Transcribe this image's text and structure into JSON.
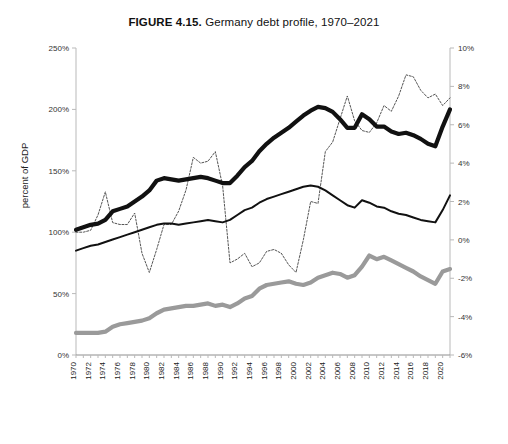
{
  "figure": {
    "label": "FIGURE 4.15.",
    "title_rest": " Germany debt profile, 1970–2021",
    "full_title": "FIGURE 4.15. Germany debt profile, 1970–2021"
  },
  "annotation": {
    "line1": "Global Financial",
    "line2": "Crisis of 2008",
    "year": 2008
  },
  "legend": {
    "position": "bottom",
    "items": [
      {
        "label": "Total debt to GDP",
        "style": "thick-solid",
        "color": "#111111"
      },
      {
        "label": "Private debt to GDP",
        "style": "thin-solid",
        "color": "#111111"
      },
      {
        "label": "Public debt to GDP",
        "style": "thick-solid",
        "color": "#9a9a9a"
      },
      {
        "label": "Current account balance to GDP (right axis scale)",
        "style": "dotted",
        "color": "#555555"
      }
    ]
  },
  "chart_data": {
    "type": "line",
    "title": "FIGURE 4.15. Germany debt profile, 1970–2021",
    "xlabel": "",
    "ylabel": "percent of GDP",
    "ylabel_right": "",
    "grid": false,
    "xlim": [
      1970,
      2021
    ],
    "ylim": [
      0,
      250
    ],
    "ylim_right": [
      -6,
      10
    ],
    "yticks": [
      "0%",
      "50%",
      "100%",
      "150%",
      "200%",
      "250%"
    ],
    "ytick_values": [
      0,
      50,
      100,
      150,
      200,
      250
    ],
    "yticks_right": [
      "-6%",
      "-4%",
      "-2%",
      "0%",
      "2%",
      "4%",
      "6%",
      "8%",
      "10%"
    ],
    "ytick_values_right": [
      -6,
      -4,
      -2,
      0,
      2,
      4,
      6,
      8,
      10
    ],
    "xtick_labels": [
      "1970",
      "1972",
      "1974",
      "1976",
      "1978",
      "1980",
      "1982",
      "1984",
      "1986",
      "1988",
      "1990",
      "1992",
      "1994",
      "1996",
      "1998",
      "2000",
      "2002",
      "2004",
      "2006",
      "2008",
      "2010",
      "2012",
      "2014",
      "2016",
      "2018",
      "2020"
    ],
    "x": [
      1970,
      1971,
      1972,
      1973,
      1974,
      1975,
      1976,
      1977,
      1978,
      1979,
      1980,
      1981,
      1982,
      1983,
      1984,
      1985,
      1986,
      1987,
      1988,
      1989,
      1990,
      1991,
      1992,
      1993,
      1994,
      1995,
      1996,
      1997,
      1998,
      1999,
      2000,
      2001,
      2002,
      2003,
      2004,
      2005,
      2006,
      2007,
      2008,
      2009,
      2010,
      2011,
      2012,
      2013,
      2014,
      2015,
      2016,
      2017,
      2018,
      2019,
      2020,
      2021
    ],
    "series": [
      {
        "name": "Total debt to GDP",
        "axis": "left",
        "style": "thick-solid",
        "color": "#111111",
        "values": [
          102,
          104,
          106,
          107,
          110,
          117,
          119,
          121,
          125,
          129,
          134,
          142,
          144,
          143,
          142,
          143,
          144,
          145,
          144,
          142,
          140,
          140,
          146,
          153,
          158,
          166,
          172,
          177,
          181,
          185,
          190,
          195,
          199,
          202,
          201,
          198,
          192,
          185,
          185,
          196,
          192,
          186,
          186,
          182,
          180,
          181,
          179,
          176,
          172,
          170,
          186,
          200
        ]
      },
      {
        "name": "Private debt to GDP",
        "axis": "left",
        "style": "thin-solid",
        "color": "#111111",
        "values": [
          85,
          87,
          89,
          90,
          92,
          94,
          96,
          98,
          100,
          102,
          104,
          106,
          107,
          107,
          106,
          107,
          108,
          109,
          110,
          109,
          108,
          110,
          114,
          118,
          120,
          124,
          127,
          129,
          131,
          133,
          135,
          137,
          138,
          137,
          134,
          130,
          126,
          122,
          120,
          126,
          124,
          121,
          120,
          117,
          115,
          114,
          112,
          110,
          109,
          108,
          118,
          130
        ]
      },
      {
        "name": "Public debt to GDP",
        "axis": "left",
        "style": "thick-solid",
        "color": "#9a9a9a",
        "values": [
          18,
          18,
          18,
          18,
          19,
          23,
          25,
          26,
          27,
          28,
          30,
          34,
          37,
          38,
          39,
          40,
          40,
          41,
          42,
          40,
          41,
          39,
          42,
          46,
          48,
          54,
          57,
          58,
          59,
          60,
          58,
          57,
          59,
          63,
          65,
          67,
          66,
          63,
          65,
          72,
          81,
          78,
          80,
          77,
          74,
          71,
          68,
          64,
          61,
          58,
          68,
          70
        ]
      },
      {
        "name": "Current account balance to GDP (right axis scale)",
        "axis": "right",
        "style": "dotted",
        "color": "#555555",
        "values": [
          0.4,
          0.4,
          0.5,
          1.3,
          2.5,
          0.9,
          0.8,
          0.8,
          1.4,
          -0.7,
          -1.7,
          -0.5,
          0.8,
          0.8,
          1.5,
          2.6,
          4.3,
          4.0,
          4.1,
          4.6,
          2.8,
          -1.2,
          -1.0,
          -0.7,
          -1.4,
          -1.2,
          -0.6,
          -0.5,
          -0.7,
          -1.3,
          -1.7,
          0.0,
          2.0,
          1.9,
          4.6,
          5.1,
          6.3,
          7.5,
          6.2,
          5.7,
          5.6,
          6.1,
          7.0,
          6.7,
          7.5,
          8.6,
          8.5,
          7.8,
          7.4,
          7.6,
          7.0,
          7.4
        ]
      }
    ]
  }
}
